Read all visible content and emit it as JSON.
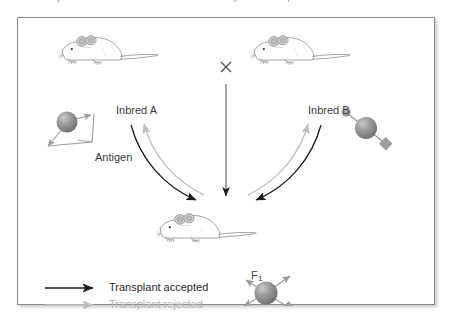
{
  "caption": {
    "text": "transplanted from one inbred strain to an F1 hybrid is accepted because th"
  },
  "figure": {
    "parents": [
      {
        "label": "Inbred A",
        "antigen_name": "triangle-spike-antigen"
      },
      {
        "label": "Inbred B",
        "antigen_name": "ball-diamond-antigen"
      }
    ],
    "cross_symbol": "×",
    "antigen_callout": "Antigen",
    "offspring": {
      "label": "F",
      "subscript": "1",
      "antigen_name": "combined-antigen"
    },
    "legend": [
      {
        "label": "Transplant accepted",
        "color": "#1a1a1a",
        "arrow": "solid-black-arrow"
      },
      {
        "label": "Transplant rejected",
        "color": "#b8b8b8",
        "arrow": "solid-gray-arrow"
      }
    ],
    "colors": {
      "accepted_arrow": "#1a1a1a",
      "rejected_arrow": "#b8b8b8",
      "frame_border": "#8a8a8e",
      "mouse_outline": "#6f6f6f",
      "antigen_fill": "#8c8c8c",
      "background": "#ffffff"
    }
  }
}
